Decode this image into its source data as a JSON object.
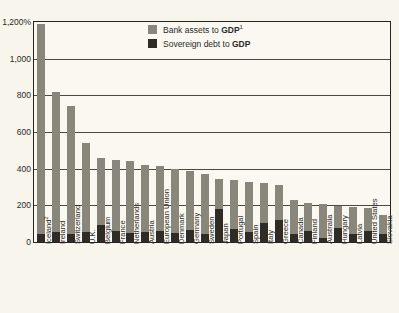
{
  "chart_data": {
    "type": "bar",
    "title": "",
    "subtitle": "",
    "xlabel": "",
    "ylabel": "",
    "unit_suffix": "%",
    "ylim": [
      0,
      1200
    ],
    "yticks": [
      0,
      200,
      400,
      600,
      800,
      1000,
      1200
    ],
    "ytick_labels": [
      "0",
      "200",
      "400",
      "600",
      "800",
      "1,000",
      "1,200%"
    ],
    "grid": true,
    "legend_position": "top-center",
    "categories": [
      "Iceland",
      "Ireland",
      "Switzerland",
      "U.K.",
      "Belgium",
      "France",
      "Netherlands",
      "Austria",
      "European Union",
      "Denmark",
      "Germany",
      "Sweden",
      "Japan",
      "Portugal",
      "Spain",
      "Italy",
      "Greece",
      "Canada",
      "Finland",
      "Australia",
      "Hungary",
      "Latvia",
      "United States",
      "Slovakia"
    ],
    "category_notes": {
      "Iceland": "2"
    },
    "series": [
      {
        "name": "Bank assets to GDP",
        "color": "#89867c",
        "values": [
          1190,
          820,
          740,
          540,
          460,
          450,
          440,
          420,
          415,
          400,
          385,
          370,
          345,
          340,
          330,
          320,
          310,
          230,
          215,
          205,
          195,
          190,
          185,
          150
        ]
      },
      {
        "name": "Sovereign debt to GDP",
        "color": "#2e2c25",
        "values": [
          45,
          55,
          42,
          52,
          95,
          58,
          48,
          52,
          58,
          50,
          64,
          45,
          180,
          72,
          55,
          105,
          120,
          42,
          58,
          22,
          78,
          42,
          62,
          42
        ]
      }
    ]
  },
  "legend": {
    "items": [
      {
        "label_prefix": "Bank assets to ",
        "label_bold": "GDP",
        "superscript": "1",
        "swatch": "legend-swatch-bank"
      },
      {
        "label_prefix": "Sovereign debt to ",
        "label_bold": "GDP",
        "superscript": "",
        "swatch": "legend-swatch-sovereign"
      }
    ]
  }
}
